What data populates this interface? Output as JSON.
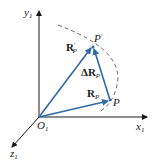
{
  "diagram": {
    "type": "vector-displacement",
    "colors": {
      "axis": "#1a1a1a",
      "vector": "#2f6aa8",
      "arc": "#555555"
    },
    "axes": {
      "y": {
        "base": "y",
        "sub": "1"
      },
      "x": {
        "base": "x",
        "sub": "1"
      },
      "z": {
        "base": "z",
        "sub": "1"
      }
    },
    "origin": {
      "base": "O",
      "sub": "1"
    },
    "points": {
      "p_prime": {
        "base": "P",
        "sup": "′"
      },
      "p": {
        "base": "P"
      }
    },
    "vectors": {
      "r_prime": {
        "base": "R",
        "sup": "′",
        "sub": "P"
      },
      "delta_r": {
        "prefix": "Δ",
        "base": "R",
        "sub": "P"
      },
      "r": {
        "base": "R",
        "sub": "P"
      }
    }
  }
}
